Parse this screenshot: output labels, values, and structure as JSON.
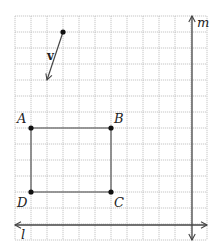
{
  "diagram": {
    "type": "coordinate-grid-geometry",
    "grid": {
      "x0": 15,
      "y0": 16,
      "cell": 16,
      "cols": 12,
      "rows": 14,
      "color": "#b8b8b8"
    },
    "colors": {
      "rectangle": "#7a7a7a",
      "lines": "#444444",
      "points": "#111111",
      "text": "#222222"
    },
    "rectangle": {
      "vertices": [
        {
          "label": "A",
          "x": 31,
          "y": 128,
          "label_x": 17,
          "label_y": 123
        },
        {
          "label": "B",
          "x": 111,
          "y": 128,
          "label_x": 114,
          "label_y": 123
        },
        {
          "label": "C",
          "x": 111,
          "y": 192,
          "label_x": 114,
          "label_y": 207
        },
        {
          "label": "D",
          "x": 31,
          "y": 192,
          "label_x": 17,
          "label_y": 207
        }
      ]
    },
    "vector": {
      "label": "v",
      "start": {
        "x": 63,
        "y": 32
      },
      "end": {
        "x": 47,
        "y": 80
      },
      "label_x": 47,
      "label_y": 60
    },
    "line_l": {
      "label": "l",
      "y": 225,
      "x1": 15,
      "x2": 207,
      "label_x": 21,
      "label_y": 239
    },
    "line_m": {
      "label": "m",
      "x": 192,
      "y1": 16,
      "y2": 240,
      "label_x": 197,
      "label_y": 27
    }
  }
}
